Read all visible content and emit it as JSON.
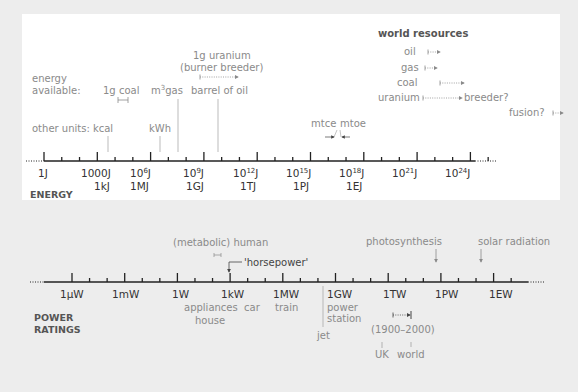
{
  "colors": {
    "background": "#ededed",
    "card": "#ffffff",
    "axis": "#222222",
    "label_dark": "#333333",
    "label_gray": "#8a8a8a",
    "heading": "#555555"
  },
  "energy": {
    "section_title": "ENERGY",
    "axis_labels": [
      {
        "top": "1J",
        "bottom": ""
      },
      {
        "top": "1000J",
        "bottom": "1kJ"
      },
      {
        "top": "10^6J",
        "bottom": "1MJ"
      },
      {
        "top": "10^9J",
        "bottom": "1GJ"
      },
      {
        "top": "10^12J",
        "bottom": "1TJ"
      },
      {
        "top": "10^15J",
        "bottom": "1PJ"
      },
      {
        "top": "10^18J",
        "bottom": "1EJ"
      },
      {
        "top": "10^21J",
        "bottom": ""
      },
      {
        "top": "10^24J",
        "bottom": ""
      }
    ],
    "energy_available_label": "energy available:",
    "energy_available_line1": "energy",
    "energy_available_line2": "available:",
    "coal_label": "1g coal",
    "gas_label": "m³ gas",
    "oil_label": "barrel of oil",
    "uranium_line1": "1g uranium",
    "uranium_line2": "(burner breeder)",
    "other_units_label": "other units: kcal",
    "kwh_label": "kWh",
    "mtce_label": "mtce",
    "mtoe_label": "mtoe",
    "world_resources": {
      "title": "world resources",
      "items": [
        "oil",
        "gas",
        "coal",
        "uranium"
      ],
      "breeder_label": "breeder?",
      "fusion_label": "fusion?"
    }
  },
  "power": {
    "section_title_line1": "POWER",
    "section_title_line2": "RATINGS",
    "axis_labels": [
      "1µW",
      "1mW",
      "1W",
      "1kW",
      "1MW",
      "1GW",
      "1TW",
      "1PW",
      "1EW"
    ],
    "human_label": "(metabolic) human",
    "horsepower_label": "'horsepower'",
    "appliances_label": "appliances",
    "car_label": "car",
    "house_label": "house",
    "train_label": "train",
    "jet_label": "jet",
    "power_station_line1": "power",
    "power_station_line2": "station",
    "photosynthesis_label": "photosynthesis",
    "solar_label": "solar radiation",
    "period_label": "(1900–2000)",
    "uk_label": "UK",
    "world_label": "world"
  }
}
